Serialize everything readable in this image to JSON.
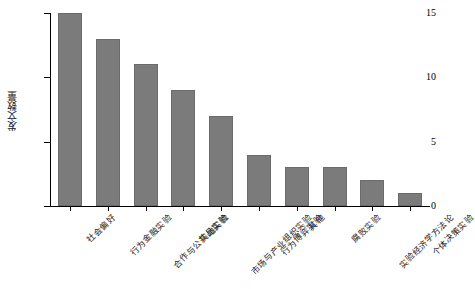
{
  "chart_data": {
    "type": "bar",
    "title": "",
    "subtitle": "",
    "xlabel": "",
    "ylabel": "发文数量",
    "ylim": [
      0,
      15
    ],
    "yticks": [
      0,
      5,
      10,
      15
    ],
    "ytick_labels": [
      "0",
      "5",
      "10",
      "15"
    ],
    "grid": false,
    "legend": false,
    "legend_position": "none",
    "bar_color": "#7b7b7b",
    "bar_edge_color": "#6b6b6b",
    "axis_color": "#000000",
    "background_color": "#ffffff",
    "categories": [
      "社会偏好",
      "行为金融实验",
      "合作与公共品实验",
      "实地实验",
      "市场与产业组织实验",
      "行为博弈实验",
      "其他",
      "腐败实验",
      "实验经济学方法论",
      "个体决策实验"
    ],
    "values": [
      15,
      13,
      11,
      9,
      7,
      4,
      3,
      3,
      2,
      1
    ]
  }
}
